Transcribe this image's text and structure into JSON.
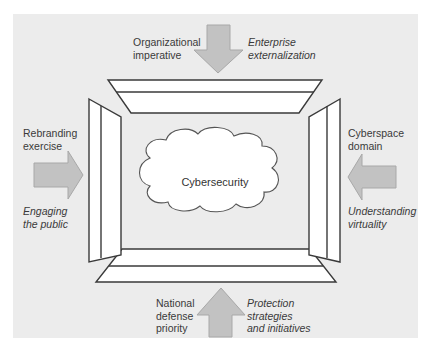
{
  "diagram": {
    "center_label": "Cybersecurity",
    "colors": {
      "background": "#ececec",
      "arrow_fill": "#c2c2c2",
      "arrow_stroke": "#a8a8a8",
      "frame_stroke": "#3a3a3a",
      "frame_fill": "#ffffff",
      "text": "#3a3a3a"
    },
    "top": {
      "label_left": [
        "Organizational",
        "imperative"
      ],
      "label_right_italic": [
        "Enterprise",
        "externalization"
      ],
      "arrow_direction": "down"
    },
    "left": {
      "label_top": [
        "Rebranding",
        "exercise"
      ],
      "label_bottom_italic": [
        "Engaging",
        "the public"
      ],
      "arrow_direction": "right"
    },
    "right": {
      "label_top": [
        "Cyberspace",
        "domain"
      ],
      "label_bottom_italic": [
        "Understanding",
        "virtuality"
      ],
      "arrow_direction": "left"
    },
    "bottom": {
      "label_left": [
        "National",
        "defense",
        "priority"
      ],
      "label_right_italic": [
        "Protection",
        "strategies",
        "and initiatives"
      ],
      "arrow_direction": "up"
    }
  }
}
